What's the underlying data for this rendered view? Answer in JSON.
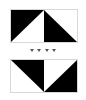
{
  "figure": {
    "colors": {
      "fill": "#000000",
      "background": "#ffffff",
      "border": "#d8d8d8",
      "marker": "#555555"
    },
    "panels": [
      {
        "id": "top",
        "cells": [
          {
            "position": "left",
            "black_triangle": "upper-left",
            "diagonal": "bottom-left to top-right"
          },
          {
            "position": "right",
            "black_triangle": "lower-left",
            "diagonal": "top-left to bottom-right"
          }
        ]
      },
      {
        "id": "bottom",
        "cells": [
          {
            "position": "left",
            "black_triangle": "upper-right",
            "diagonal": "top-left to bottom-right"
          },
          {
            "position": "right",
            "black_triangle": "lower-right",
            "diagonal": "bottom-left to top-right"
          }
        ]
      }
    ],
    "separator": {
      "type": "continuation-marker",
      "count": 4,
      "glyph": "▼"
    }
  }
}
